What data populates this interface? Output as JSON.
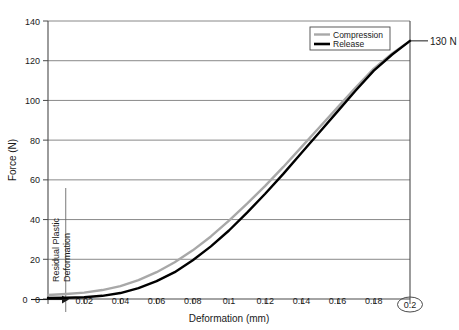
{
  "chart_data": {
    "type": "line",
    "title": "",
    "xlabel": "Deformation (mm)",
    "ylabel": "Force (N)",
    "xlim": [
      0,
      0.2
    ],
    "ylim": [
      0,
      140
    ],
    "grid": "horizontal",
    "legend_position": "top-right",
    "x_ticks": [
      "0",
      "0.02",
      "0.04",
      "0.06",
      "0.08",
      "0.1",
      "0.12",
      "0.14",
      "0.16",
      "0.18",
      "0.2"
    ],
    "x_tick_values": [
      0,
      0.02,
      0.04,
      0.06,
      0.08,
      0.1,
      0.12,
      0.14,
      0.16,
      0.18,
      0.2
    ],
    "y_ticks": [
      "0",
      "20",
      "40",
      "60",
      "80",
      "100",
      "120",
      "140"
    ],
    "y_tick_values": [
      0,
      20,
      40,
      60,
      80,
      100,
      120,
      140
    ],
    "series": [
      {
        "name": "Compression",
        "color": "#a8a8a8",
        "width": 2.4,
        "x": [
          0,
          0.01,
          0.02,
          0.03,
          0.04,
          0.05,
          0.06,
          0.07,
          0.08,
          0.09,
          0.1,
          0.11,
          0.12,
          0.13,
          0.14,
          0.15,
          0.16,
          0.17,
          0.18,
          0.19,
          0.2
        ],
        "values": [
          2,
          2.5,
          3.2,
          4.5,
          6.5,
          9.5,
          13.5,
          18.5,
          24.5,
          31.5,
          39.5,
          48,
          57,
          66.5,
          76.5,
          86.5,
          96.5,
          106.5,
          116,
          123.5,
          130
        ]
      },
      {
        "name": "Release",
        "color": "#000000",
        "width": 2.4,
        "x": [
          0,
          0.01,
          0.02,
          0.03,
          0.04,
          0.05,
          0.06,
          0.07,
          0.08,
          0.09,
          0.1,
          0.11,
          0.12,
          0.13,
          0.14,
          0.15,
          0.16,
          0.17,
          0.18,
          0.19,
          0.2
        ],
        "values": [
          0.5,
          0.6,
          0.9,
          1.6,
          3,
          5.5,
          9,
          13.5,
          19.5,
          26.5,
          34.5,
          43.5,
          53,
          63,
          73.5,
          84,
          94.5,
          105,
          115,
          123,
          130
        ]
      }
    ],
    "annotations": [
      {
        "name": "endpoint-callout",
        "label": "130 N",
        "at_x": 0.2,
        "at_y": 130
      },
      {
        "name": "residual-plastic-deformation",
        "label_line1": "Residual Plastic",
        "label_line2": "Deformation",
        "marker_x": 0.0098,
        "arrow_from_x": 0,
        "arrow_to_x": 0.0098,
        "arrow_origin_label": "0"
      },
      {
        "name": "highlighted-x-tick",
        "label": "0.2",
        "style": "circled"
      }
    ]
  }
}
